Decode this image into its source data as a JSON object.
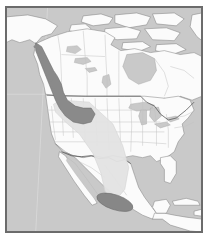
{
  "figure": {
    "type": "species-range-map",
    "region": "North America",
    "title": "",
    "caption": "",
    "background_color": "#ffffff",
    "frame": {
      "border_color": "#6b6b6b",
      "border_width_px": 1,
      "x": 5,
      "y": 6,
      "width": 198,
      "height": 227
    }
  },
  "map": {
    "projection_note": "conic, North America centered",
    "colors": {
      "ocean": "#c9c9c9",
      "land": "#fbfbfb",
      "land_outline": "#7d7d7d",
      "political_boundary": "#b8b8b8",
      "international_boundary": "#5d5d5d",
      "lake": "#c9c9c9",
      "breeding_range": "#8a8a8a",
      "breeding_range_outline": "#6e6e6e",
      "migration_corridor": "#e2e2e2",
      "migration_corridor_outline": "#cfcfcf",
      "wintering_range": "#878787",
      "wintering_range_outline": "#6e6e6e"
    },
    "legend_present": false,
    "labels_present": false,
    "graticule": {
      "visible": true,
      "color": "#dcdcdc"
    }
  },
  "ranges": [
    {
      "name": "breeding-range",
      "shade": "dark-gray",
      "color": "#8a8a8a",
      "description": "Pacific Northwest coast, British Columbia, Idaho, Montana, Wyoming"
    },
    {
      "name": "migration-corridor",
      "shade": "light-gray",
      "color": "#e2e2e2",
      "description": "Wedge narrowing southward from Great Basin through the Southwest into Mexico"
    },
    {
      "name": "wintering-range",
      "shade": "dark-gray",
      "color": "#878787",
      "description": "Elongated oval across central Mexico"
    }
  ],
  "landmasses": [
    "Alaska",
    "Canada",
    "Arctic Archipelago",
    "Greenland edge",
    "United States",
    "Mexico",
    "Baja California",
    "Central America",
    "Cuba",
    "Hispaniola",
    "Florida"
  ],
  "water_features": [
    "Pacific Ocean",
    "Atlantic Ocean",
    "Gulf of Mexico",
    "Hudson Bay",
    "Great Lakes",
    "Gulf of California",
    "Great Slave Lake",
    "Great Bear Lake",
    "Lake Winnipeg",
    "Caribbean Sea"
  ]
}
